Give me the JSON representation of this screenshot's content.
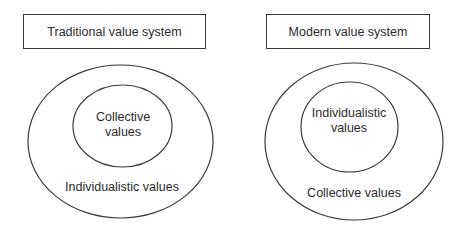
{
  "diagrams": [
    {
      "title": "Traditional value system",
      "inner_circle": {
        "line1": "Collective",
        "line2": "values"
      },
      "outer_circle": {
        "label": "Individualistic values"
      }
    },
    {
      "title": "Modern value system",
      "inner_circle": {
        "line1": "Individualistic",
        "line2": "values"
      },
      "outer_circle": {
        "label": "Collective values"
      }
    }
  ],
  "colors": {
    "stroke": "#3a3a3a",
    "text": "#2a2a2a",
    "background": "#ffffff"
  }
}
